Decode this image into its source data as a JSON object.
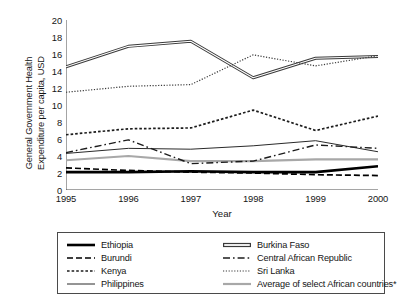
{
  "chart_data": {
    "type": "line",
    "title": "",
    "xlabel": "Year",
    "ylabel": "General Government Health Expenditure per capita, USD",
    "ylabel_line1": "General Government Health",
    "ylabel_line2": "Expenditure per capita, USD",
    "categories": [
      "1995",
      "1996",
      "1997",
      "1998",
      "1999",
      "2000"
    ],
    "x": [
      1995,
      1996,
      1997,
      1998,
      1999,
      2000
    ],
    "xlim": [
      1995,
      2000
    ],
    "ylim": [
      0,
      20
    ],
    "ytick_step": 2,
    "yticks": [
      "20",
      "18",
      "16",
      "14",
      "12",
      "10",
      "8",
      "6",
      "4",
      "2",
      "0"
    ],
    "ytick_values": [
      20,
      18,
      16,
      14,
      12,
      10,
      8,
      6,
      4,
      2,
      0
    ],
    "grid": false,
    "legend_position": "below-plot",
    "legend_columns": 2,
    "footnote_marker": "*",
    "series": [
      {
        "name": "Ethiopia",
        "values": [
          2.1,
          2.1,
          2.2,
          2.1,
          2.1,
          2.8
        ],
        "style": "solid-thick",
        "color": "#000000",
        "width": 2.6
      },
      {
        "name": "Burkina Faso",
        "values": [
          14.5,
          16.9,
          17.5,
          13.2,
          15.5,
          15.7
        ],
        "style": "double-line",
        "color": "#3a3a3a",
        "width": 1.2
      },
      {
        "name": "Burundi",
        "values": [
          2.6,
          2.3,
          2.1,
          2.0,
          1.8,
          1.7
        ],
        "style": "dashed",
        "color": "#000000",
        "width": 1.7
      },
      {
        "name": "Central African Republic",
        "values": [
          4.4,
          5.9,
          3.1,
          3.4,
          5.3,
          4.9
        ],
        "style": "dash-dot",
        "color": "#1c1c1c",
        "width": 1.4
      },
      {
        "name": "Kenya",
        "values": [
          6.5,
          7.2,
          7.3,
          9.4,
          7.0,
          8.7
        ],
        "style": "dotted-coarse",
        "color": "#1c1c1c",
        "width": 1.7
      },
      {
        "name": "Sri Lanka",
        "values": [
          11.5,
          12.2,
          12.4,
          15.9,
          14.6,
          15.8
        ],
        "style": "dotted-fine",
        "color": "#3a3a3a",
        "width": 1.2
      },
      {
        "name": "Philippines",
        "values": [
          4.3,
          4.9,
          4.8,
          5.2,
          5.8,
          4.5
        ],
        "style": "solid-thin",
        "color": "#2a2a2a",
        "width": 1.0
      },
      {
        "name": "Average of select African countries*",
        "values": [
          3.5,
          4.0,
          3.4,
          3.4,
          3.6,
          3.6
        ],
        "style": "solid-gray",
        "color": "#a8a8a8",
        "width": 2.2
      }
    ]
  },
  "legend": {
    "items": [
      {
        "label": "Ethiopia",
        "series": "Ethiopia"
      },
      {
        "label": "Burkina Faso",
        "series": "Burkina Faso"
      },
      {
        "label": "Burundi",
        "series": "Burundi"
      },
      {
        "label": "Central African Republic",
        "series": "Central African Republic"
      },
      {
        "label": "Kenya",
        "series": "Kenya"
      },
      {
        "label": "Sri Lanka",
        "series": "Sri Lanka"
      },
      {
        "label": "Philippines",
        "series": "Philippines"
      },
      {
        "label": "Average of select African countries*",
        "series": "Average of select African countries*"
      }
    ]
  }
}
